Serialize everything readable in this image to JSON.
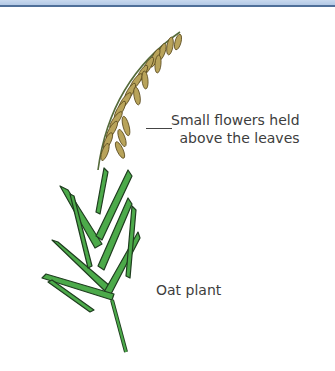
{
  "diagram": {
    "labels": {
      "flowers_line1": "Small flowers held",
      "flowers_line2": "above the leaves",
      "plant_name": "Oat plant"
    },
    "colors": {
      "border_accent": "#4f6f99",
      "leaf_green": "#4caa4a",
      "leaf_outline": "#1f3d1f",
      "flower_tan": "#b8a35a",
      "text": "#3d3d3d"
    }
  }
}
